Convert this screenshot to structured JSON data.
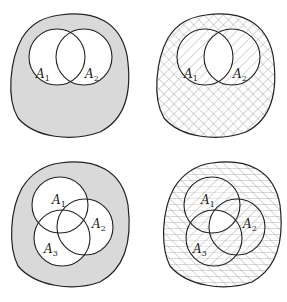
{
  "figure": {
    "colors": {
      "shade": "#d9d9d9",
      "stroke": "#222222",
      "hatch": "#9a9a9a",
      "background": "#ffffff"
    },
    "panels": [
      {
        "id": "top-left",
        "fill": "solid-gray",
        "sets": [
          {
            "base": "A",
            "sub": "1"
          },
          {
            "base": "A",
            "sub": "2"
          }
        ]
      },
      {
        "id": "top-right",
        "fill": "hatched",
        "sets": [
          {
            "base": "A",
            "sub": "1"
          },
          {
            "base": "A",
            "sub": "2"
          }
        ]
      },
      {
        "id": "bottom-left",
        "fill": "solid-gray",
        "sets": [
          {
            "base": "A",
            "sub": "1"
          },
          {
            "base": "A",
            "sub": "2"
          },
          {
            "base": "A",
            "sub": "3"
          }
        ]
      },
      {
        "id": "bottom-right",
        "fill": "hatched",
        "sets": [
          {
            "base": "A",
            "sub": "1"
          },
          {
            "base": "A",
            "sub": "2"
          },
          {
            "base": "A",
            "sub": "3"
          }
        ]
      }
    ]
  }
}
